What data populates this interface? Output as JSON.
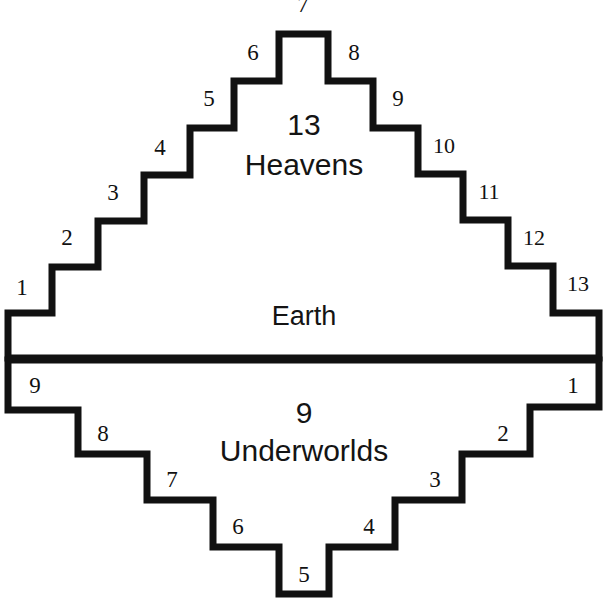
{
  "diagram": {
    "colors": {
      "outline": "#111111",
      "fill": "#ffffff",
      "text": "#141414",
      "background": "#ffffff"
    },
    "realms": {
      "upper": {
        "count": "13",
        "name": "Heavens"
      },
      "middle": {
        "name": "Earth"
      },
      "lower": {
        "count": "9",
        "name": "Underworlds"
      }
    },
    "heaven_steps": [
      {
        "label": "1",
        "x": 22,
        "y": 295
      },
      {
        "label": "2",
        "x": 67,
        "y": 245
      },
      {
        "label": "3",
        "x": 113,
        "y": 200
      },
      {
        "label": "4",
        "x": 160,
        "y": 155
      },
      {
        "label": "5",
        "x": 209,
        "y": 106
      },
      {
        "label": "6",
        "x": 253,
        "y": 60
      },
      {
        "label": "7",
        "x": 303,
        "y": 12
      },
      {
        "label": "8",
        "x": 354,
        "y": 60
      },
      {
        "label": "9",
        "x": 398,
        "y": 106
      },
      {
        "label": "10",
        "x": 444,
        "y": 153
      },
      {
        "label": "11",
        "x": 489,
        "y": 199
      },
      {
        "label": "12",
        "x": 534,
        "y": 245
      },
      {
        "label": "13",
        "x": 578,
        "y": 291
      }
    ],
    "underworld_steps": [
      {
        "label": "1",
        "x": 573,
        "y": 393
      },
      {
        "label": "2",
        "x": 503,
        "y": 441
      },
      {
        "label": "3",
        "x": 435,
        "y": 487
      },
      {
        "label": "4",
        "x": 369,
        "y": 534
      },
      {
        "label": "5",
        "x": 304,
        "y": 582
      },
      {
        "label": "6",
        "x": 238,
        "y": 534
      },
      {
        "label": "7",
        "x": 172,
        "y": 487
      },
      {
        "label": "8",
        "x": 103,
        "y": 441
      },
      {
        "label": "9",
        "x": 35,
        "y": 393
      }
    ],
    "text_positions": {
      "heavens_count": {
        "x": 304,
        "y": 135
      },
      "heavens_name": {
        "x": 304,
        "y": 175
      },
      "earth_name": {
        "x": 304,
        "y": 325
      },
      "underworlds_count": {
        "x": 304,
        "y": 423
      },
      "underworlds_name": {
        "x": 304,
        "y": 461
      }
    },
    "geometry": {
      "pyramid_path": "M 8,358 L 8,313 L 52,313 L 52,267 L 98,267 L 98,221 L 144,221 L 144,175 L 190,175 L 190,128 L 234,128 L 234,81 L 279,81 L 279,34 L 328,34 L 328,81 L 373,81 L 373,128 L 418,128 L 418,174 L 463,174 L 463,220 L 508,220 L 508,266 L 553,266 L 553,313 L 599,313 L 599,358 Z",
      "underworld_path": "M 8,360 L 8,410 L 78,410 L 78,454 L 147,454 L 147,500 L 213,500 L 213,547 L 279,547 L 279,594 L 329,594 L 329,547 L 395,547 L 395,500 L 462,500 L 462,454 L 530,454 L 530,407 L 599,407 L 599,360 Z",
      "earth_line": {
        "x1": 6,
        "y1": 359,
        "x2": 601,
        "y2": 359
      }
    }
  }
}
